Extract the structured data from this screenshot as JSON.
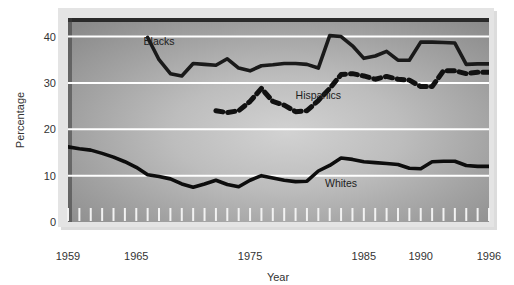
{
  "chart_data": {
    "type": "line",
    "title": "",
    "xlabel": "Year",
    "ylabel": "Percentage",
    "xlim": [
      1959,
      1996
    ],
    "ylim": [
      0,
      44
    ],
    "grid": true,
    "gridlines_y": [
      10,
      20,
      30,
      40
    ],
    "ytick_labels": [
      "0",
      "10",
      "20",
      "30",
      "40"
    ],
    "ytick_values": [
      0,
      10,
      20,
      30,
      40
    ],
    "xtick_labels": [
      "1959",
      "1965",
      "1975",
      "1985",
      "1990",
      "1996"
    ],
    "xtick_values": [
      1959,
      1965,
      1975,
      1985,
      1990,
      1996
    ],
    "minor_xticks_every": 1,
    "legend": "inline-labels",
    "series": [
      {
        "name": "Blacks",
        "style": "solid",
        "color": "#1a1a1a",
        "label_x": 1967,
        "label_y": 38.2,
        "x": [
          1966,
          1967,
          1968,
          1969,
          1970,
          1971,
          1972,
          1973,
          1974,
          1975,
          1976,
          1977,
          1978,
          1979,
          1980,
          1981,
          1982,
          1983,
          1984,
          1985,
          1986,
          1987,
          1988,
          1989,
          1990,
          1991,
          1992,
          1993,
          1994,
          1995,
          1996
        ],
        "values": [
          39.8,
          35.0,
          32.0,
          31.5,
          34.2,
          34.0,
          33.8,
          35.2,
          33.2,
          32.6,
          33.7,
          33.9,
          34.2,
          34.2,
          34.0,
          33.2,
          40.2,
          40.0,
          38.0,
          35.3,
          35.8,
          36.8,
          34.9,
          34.9,
          38.8,
          38.8,
          38.7,
          38.6,
          34.0,
          34.1,
          34.1
        ]
      },
      {
        "name": "Hispanics",
        "style": "dashed",
        "color": "#111111",
        "label_x": 1981,
        "label_y": 26.5,
        "x": [
          1972,
          1973,
          1974,
          1975,
          1976,
          1977,
          1978,
          1979,
          1980,
          1981,
          1982,
          1983,
          1984,
          1985,
          1986,
          1987,
          1988,
          1989,
          1990,
          1991,
          1992,
          1993,
          1994,
          1995,
          1996
        ],
        "values": [
          24.0,
          23.6,
          24.0,
          26.0,
          28.8,
          26.0,
          25.2,
          23.8,
          24.0,
          26.2,
          28.8,
          31.8,
          32.0,
          31.5,
          30.8,
          31.4,
          30.8,
          30.6,
          29.2,
          29.2,
          32.6,
          32.6,
          32.0,
          32.3,
          32.3
        ]
      },
      {
        "name": "Whites",
        "style": "solid",
        "color": "#0d0d0d",
        "label_x": 1983,
        "label_y": 7.6,
        "x": [
          1959,
          1960,
          1961,
          1962,
          1963,
          1964,
          1965,
          1966,
          1967,
          1968,
          1969,
          1970,
          1971,
          1972,
          1973,
          1974,
          1975,
          1976,
          1977,
          1978,
          1979,
          1980,
          1981,
          1982,
          1983,
          1984,
          1985,
          1986,
          1987,
          1988,
          1989,
          1990,
          1991,
          1992,
          1993,
          1994,
          1995,
          1996
        ],
        "values": [
          16.2,
          15.8,
          15.5,
          14.8,
          14.0,
          13.0,
          11.8,
          10.2,
          9.8,
          9.3,
          8.2,
          7.5,
          8.2,
          9.0,
          8.1,
          7.6,
          9.0,
          10.0,
          9.5,
          9.0,
          8.7,
          8.8,
          11.0,
          12.2,
          13.8,
          13.5,
          13.0,
          12.8,
          12.6,
          12.4,
          11.6,
          11.5,
          13.0,
          13.1,
          13.1,
          12.2,
          12.0,
          12.0
        ]
      }
    ]
  },
  "axes": {
    "y_axis_title": "Percentage",
    "x_axis_title": "Year"
  },
  "colors": {
    "plot_bg_light": "#c9c9c9",
    "plot_bg_dark": "#8c8c8c",
    "frame": "#d8d8d8",
    "gridline": "#ffffff",
    "top_border": "#222222",
    "page_bg": "#ffffff"
  }
}
